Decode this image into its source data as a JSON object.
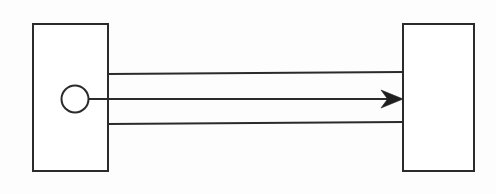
{
  "diagram": {
    "background_color": "#fdfdfd",
    "stroke_color": "#2b2b2b",
    "arrow_color": "#1f1f1f",
    "stroke_width": 2,
    "canvas": {
      "width": 496,
      "height": 194
    },
    "shapes": [
      {
        "id": "left-block",
        "name": "left-rectangle",
        "type": "rectangle",
        "x": 33,
        "y": 24,
        "width": 75,
        "height": 147,
        "label": ""
      },
      {
        "id": "right-block",
        "name": "right-rectangle",
        "type": "rectangle",
        "x": 403,
        "y": 24,
        "width": 71,
        "height": 147,
        "label": ""
      },
      {
        "id": "pivot-circle",
        "name": "circle-node",
        "type": "circle",
        "cx": 75,
        "cy": 99,
        "r": 13.5,
        "label": ""
      }
    ],
    "connectors": [
      {
        "id": "upper-rail",
        "name": "upper-connector-line",
        "type": "line",
        "x1": 108,
        "y1": 74,
        "x2": 403,
        "y2": 72,
        "arrow": false
      },
      {
        "id": "center-shaft",
        "name": "center-connector-arrow",
        "type": "line",
        "x1": 89,
        "y1": 99,
        "x2": 403,
        "y2": 99,
        "arrow": true,
        "arrow_position": "end"
      },
      {
        "id": "lower-rail",
        "name": "lower-connector-line",
        "type": "line",
        "x1": 108,
        "y1": 124,
        "x2": 403,
        "y2": 122,
        "arrow": false
      }
    ],
    "arrow_head": {
      "name": "arrow-head-right",
      "tip_x": 403,
      "tip_y": 99,
      "length": 22,
      "half_width": 9
    },
    "annotations": []
  }
}
